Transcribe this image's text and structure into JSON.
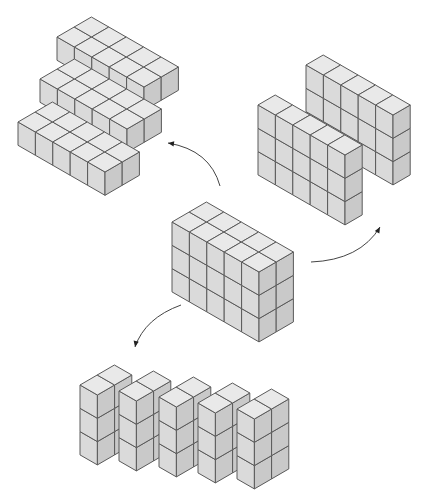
{
  "diagram": {
    "title": "",
    "colors": {
      "background": "#ffffff",
      "top_face": "#e9e9e9",
      "front_face": "#dadada",
      "side_face": "#c9c9c9",
      "edge": "#5a5a5a",
      "arrow": "#444444"
    },
    "geometry": {
      "x_axis": [
        17.4,
        10
      ],
      "y_axis": [
        17.2,
        -10
      ],
      "z_height": 23.3
    },
    "center_block": {
      "name": "rectangular-prism-5x2x3",
      "width": 5,
      "depth": 2,
      "height": 3,
      "origin": [
        172,
        222
      ]
    },
    "pieces": [
      {
        "group": "horizontal-layers",
        "name": "layer-top",
        "width": 5,
        "depth": 2,
        "height": 1,
        "origin": [
          57,
          37
        ]
      },
      {
        "group": "horizontal-layers",
        "name": "layer-middle",
        "width": 5,
        "depth": 2,
        "height": 1,
        "origin": [
          40,
          79
        ]
      },
      {
        "group": "horizontal-layers",
        "name": "layer-bottom",
        "width": 5,
        "depth": 2,
        "height": 1,
        "origin": [
          18,
          122
        ]
      },
      {
        "group": "vertical-walls",
        "name": "wall-back",
        "width": 5,
        "depth": 1,
        "height": 3,
        "origin": [
          306,
          65
        ]
      },
      {
        "group": "vertical-walls",
        "name": "wall-front",
        "width": 5,
        "depth": 1,
        "height": 3,
        "origin": [
          258,
          105
        ]
      },
      {
        "group": "columns",
        "name": "column-1",
        "width": 1,
        "depth": 2,
        "height": 3,
        "origin": [
          80,
          385
        ]
      },
      {
        "group": "columns",
        "name": "column-2",
        "width": 1,
        "depth": 2,
        "height": 3,
        "origin": [
          119,
          391
        ]
      },
      {
        "group": "columns",
        "name": "column-3",
        "width": 1,
        "depth": 2,
        "height": 3,
        "origin": [
          159,
          397
        ]
      },
      {
        "group": "columns",
        "name": "column-4",
        "width": 1,
        "depth": 2,
        "height": 3,
        "origin": [
          198,
          403
        ]
      },
      {
        "group": "columns",
        "name": "column-5",
        "width": 1,
        "depth": 2,
        "height": 3,
        "origin": [
          237,
          409
        ]
      }
    ],
    "arrows": [
      {
        "name": "arrow-to-layers",
        "path": "M 220 186 Q 210 150 168 143",
        "head": [
          168,
          143
        ],
        "dir": [
          -1,
          -0.15
        ]
      },
      {
        "name": "arrow-to-walls",
        "path": "M 311 262 Q 360 260 380 227",
        "head": [
          380,
          227
        ],
        "dir": [
          0.5,
          -0.9
        ]
      },
      {
        "name": "arrow-to-columns",
        "path": "M 181 305 Q 145 318 135 347",
        "head": [
          135,
          347
        ],
        "dir": [
          -0.2,
          1
        ]
      }
    ]
  }
}
